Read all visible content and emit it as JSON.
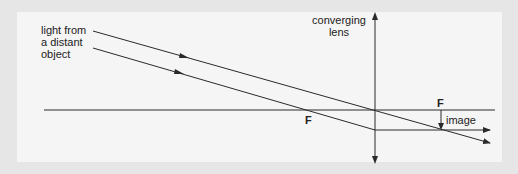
{
  "diagram": {
    "labels": {
      "light_line1": "light from",
      "light_line2": "a distant",
      "light_line3": "object",
      "lens_line1": "converging",
      "lens_line2": "lens",
      "focal_left": "F",
      "focal_right": "F",
      "image": "image"
    },
    "colors": {
      "background": "#e6e6e6",
      "panel": "#f5f5f5",
      "line": "#2a2a2a"
    }
  }
}
